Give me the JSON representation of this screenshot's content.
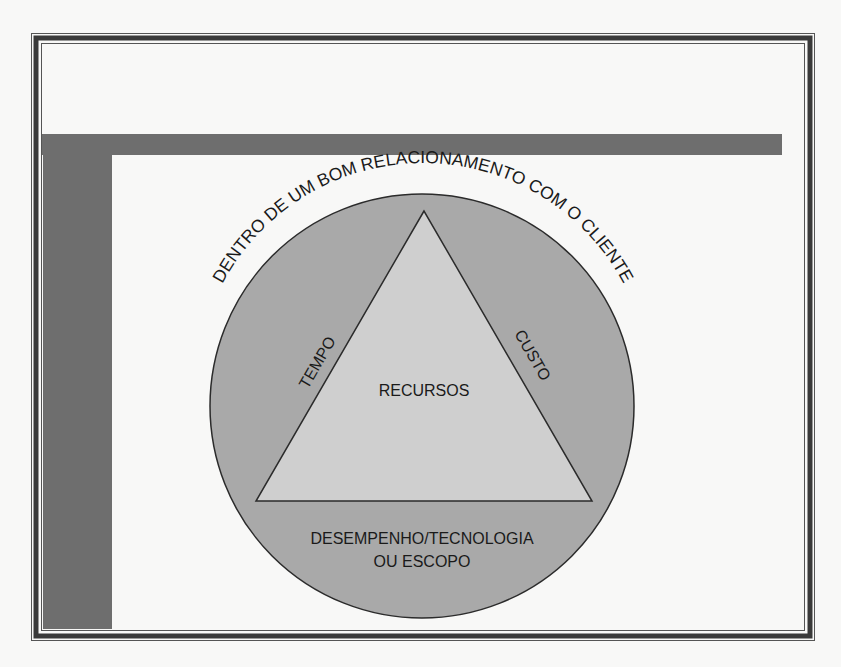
{
  "diagram": {
    "type": "triangle-in-circle",
    "outer_label": "DENTRO DE UM BOM RELACIONAMENTO COM O CLIENTE",
    "center_label": "RECURSOS",
    "left_side_label": "TEMPO",
    "right_side_label": "CUSTO",
    "base_label_line1": "DESEMPENHO/TECNOLOGIA",
    "base_label_line2": "OU ESCOPO"
  },
  "colors": {
    "page_background": "#f8f8f7",
    "frame_dark": "#3a3a3a",
    "bar_gray": "#6e6e6e",
    "circle_fill": "#a9a9a9",
    "triangle_fill": "#cfcfcf",
    "stroke": "#2b2b2b",
    "text": "#1a1a1a"
  }
}
